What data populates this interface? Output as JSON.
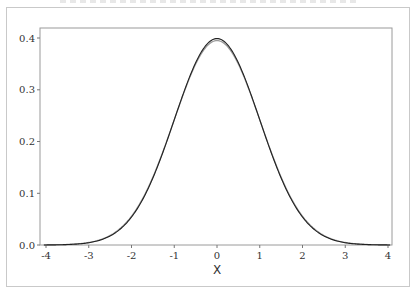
{
  "chart_data": {
    "type": "line",
    "title": "",
    "xlabel": "X",
    "ylabel": "",
    "xlim": [
      -4.15,
      4.1
    ],
    "ylim": [
      0.0,
      0.42
    ],
    "grid": false,
    "legend": null,
    "x_ticks": [
      -4,
      -3,
      -2,
      -1,
      0,
      1,
      2,
      3,
      4
    ],
    "x_tick_labels": [
      "-4",
      "-3",
      "-2",
      "-1",
      "0",
      "1",
      "2",
      "3",
      "4"
    ],
    "y_ticks": [
      0.0,
      0.1,
      0.2,
      0.3,
      0.4
    ],
    "y_tick_labels": [
      "0.0",
      "0.1",
      "0.2",
      "0.3",
      "0.4"
    ],
    "series": [
      {
        "name": "standard normal density (dark)",
        "color": "#222222",
        "x": [
          -4,
          -3.5,
          -3,
          -2.5,
          -2,
          -1.5,
          -1,
          -0.5,
          0,
          0.5,
          1,
          1.5,
          2,
          2.5,
          3,
          3.5,
          4
        ],
        "values": [
          0.0001,
          0.0009,
          0.0044,
          0.0175,
          0.054,
          0.1295,
          0.242,
          0.3521,
          0.3989,
          0.3521,
          0.242,
          0.1295,
          0.054,
          0.0175,
          0.0044,
          0.0009,
          0.0001
        ]
      },
      {
        "name": "estimated density (gray)",
        "color": "#9a9a9a",
        "x": [
          -4,
          -3.5,
          -3,
          -2.5,
          -2,
          -1.5,
          -1,
          -0.5,
          0,
          0.5,
          1,
          1.5,
          2,
          2.5,
          3,
          3.5,
          4
        ],
        "values": [
          0.0002,
          0.0013,
          0.0055,
          0.0195,
          0.056,
          0.1305,
          0.241,
          0.3495,
          0.395,
          0.3495,
          0.241,
          0.1305,
          0.056,
          0.0195,
          0.0055,
          0.0013,
          0.0002
        ]
      }
    ]
  },
  "labels": {
    "xlabel": "X",
    "x_ticks": [
      "-4",
      "-3",
      "-2",
      "-1",
      "0",
      "1",
      "2",
      "3",
      "4"
    ],
    "y_ticks": [
      "0.0",
      "0.1",
      "0.2",
      "0.3",
      "0.4"
    ]
  }
}
